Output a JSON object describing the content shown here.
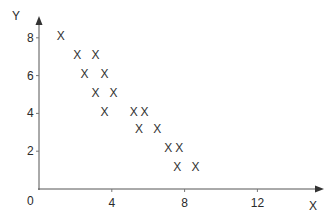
{
  "chart_data": {
    "type": "scatter",
    "title": "",
    "xlabel": "X",
    "ylabel": "Y",
    "marker": "X",
    "xlim": [
      0,
      15
    ],
    "ylim": [
      0,
      9
    ],
    "grid": false,
    "legend": null,
    "x_ticks": [
      0,
      4,
      8,
      12
    ],
    "y_ticks": [
      0,
      2,
      4,
      6,
      8
    ],
    "x_tick_labels": [
      "4",
      "8",
      "12"
    ],
    "y_tick_labels": [
      "2",
      "4",
      "6",
      "8"
    ],
    "origin_label": "0",
    "points": [
      {
        "x": 1.2,
        "y": 8.1
      },
      {
        "x": 2.1,
        "y": 7.1
      },
      {
        "x": 3.1,
        "y": 7.1
      },
      {
        "x": 2.5,
        "y": 6.1
      },
      {
        "x": 3.6,
        "y": 6.1
      },
      {
        "x": 3.1,
        "y": 5.1
      },
      {
        "x": 4.1,
        "y": 5.1
      },
      {
        "x": 3.6,
        "y": 4.1
      },
      {
        "x": 5.2,
        "y": 4.1
      },
      {
        "x": 5.8,
        "y": 4.1
      },
      {
        "x": 5.5,
        "y": 3.2
      },
      {
        "x": 6.5,
        "y": 3.2
      },
      {
        "x": 7.1,
        "y": 2.2
      },
      {
        "x": 7.7,
        "y": 2.2
      },
      {
        "x": 7.6,
        "y": 1.2
      },
      {
        "x": 8.6,
        "y": 1.2
      }
    ]
  },
  "colors": {
    "axis": "#555555",
    "text": "#2a2a2a",
    "marker": "#333333",
    "background": "#ffffff"
  }
}
